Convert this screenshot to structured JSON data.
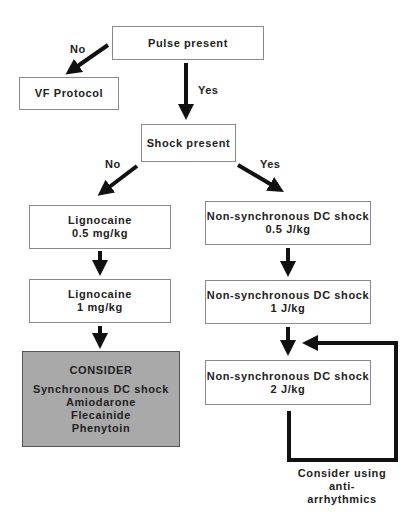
{
  "flowchart": {
    "nodes": {
      "pulse": {
        "label": "Pulse present"
      },
      "vf": {
        "label": "VF Protocol"
      },
      "shock": {
        "label": "Shock present"
      },
      "lig1": {
        "line1": "Lignocaine",
        "line2": "0.5 mg/kg"
      },
      "lig2": {
        "line1": "Lignocaine",
        "line2": "1 mg/kg"
      },
      "consider": {
        "title": "CONSIDER",
        "items": [
          "Synchronous DC shock",
          "Amiodarone",
          "Flecainide",
          "Phenytoin"
        ]
      },
      "dc1": {
        "line1": "Non-synchronous DC shock",
        "line2": "0.5 J/kg"
      },
      "dc2": {
        "line1": "Non-synchronous DC shock",
        "line2": "1 J/kg"
      },
      "dc3": {
        "line1": "Non-synchronous DC shock",
        "line2": "2 J/kg"
      }
    },
    "edge_labels": {
      "pulse_no": "No",
      "pulse_yes": "Yes",
      "shock_no": "No",
      "shock_yes": "Yes"
    },
    "loop_note": {
      "line1": "Consider using",
      "line2": "anti-arrhythmics"
    },
    "colors": {
      "consider_fill": "#a9a9a9",
      "arrow": "#111111",
      "border": "#8a8a8a"
    }
  }
}
